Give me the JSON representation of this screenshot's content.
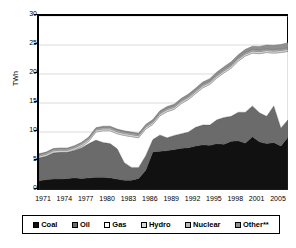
{
  "chart_data": {
    "type": "area",
    "title": "",
    "xlabel": "",
    "ylabel": "TWh",
    "ylim": [
      0,
      30
    ],
    "yticks": [
      0,
      5,
      10,
      15,
      20,
      25,
      30
    ],
    "xticks": [
      "1971",
      "1974",
      "1977",
      "1980",
      "1983",
      "1986",
      "1989",
      "1992",
      "1995",
      "1998",
      "2001",
      "2005"
    ],
    "grid": true,
    "stacked": true,
    "legend_position": "bottom",
    "x": [
      1971,
      1972,
      1973,
      1974,
      1975,
      1976,
      1977,
      1978,
      1979,
      1980,
      1981,
      1982,
      1983,
      1984,
      1985,
      1986,
      1987,
      1988,
      1989,
      1990,
      1991,
      1992,
      1993,
      1994,
      1995,
      1996,
      1997,
      1998,
      1999,
      2000,
      2001,
      2002,
      2003,
      2004,
      2005,
      2006
    ],
    "series": [
      {
        "name": "Coal",
        "color": "#111111",
        "values": [
          1.6,
          1.8,
          1.9,
          1.9,
          2.0,
          2.1,
          2.0,
          2.1,
          2.2,
          2.2,
          2.1,
          1.9,
          1.7,
          1.7,
          2.0,
          3.4,
          6.6,
          6.7,
          6.8,
          7.0,
          7.2,
          7.3,
          7.6,
          7.8,
          7.7,
          8.0,
          7.9,
          8.4,
          8.5,
          8.1,
          9.2,
          8.3,
          8.0,
          8.2,
          7.6,
          9.1
        ]
      },
      {
        "name": "Oil",
        "color": "#6b6b6b",
        "values": [
          3.9,
          4.0,
          4.5,
          4.6,
          4.5,
          4.7,
          5.3,
          5.9,
          6.4,
          6.0,
          5.9,
          5.2,
          3.0,
          2.2,
          1.9,
          2.5,
          2.1,
          2.8,
          2.2,
          2.4,
          2.5,
          2.7,
          3.2,
          3.4,
          3.5,
          4.1,
          4.6,
          4.3,
          4.9,
          5.3,
          5.3,
          5.0,
          4.7,
          6.3,
          3.1,
          3.0
        ]
      },
      {
        "name": "Gas",
        "color": "#ffffff",
        "values": [
          0.0,
          0.0,
          0.0,
          0.0,
          0.0,
          0.1,
          0.2,
          0.4,
          1.4,
          2.0,
          2.2,
          2.6,
          4.7,
          5.3,
          5.1,
          4.6,
          2.6,
          3.3,
          4.5,
          4.5,
          5.2,
          5.6,
          5.8,
          6.4,
          7.0,
          7.2,
          7.7,
          8.3,
          8.8,
          9.7,
          9.1,
          10.2,
          11.0,
          9.1,
          13.0,
          11.8
        ]
      },
      {
        "name": "Hydro",
        "color": "#d8d8d8",
        "values": [
          0.35,
          0.35,
          0.35,
          0.35,
          0.35,
          0.35,
          0.35,
          0.35,
          0.35,
          0.35,
          0.35,
          0.35,
          0.35,
          0.35,
          0.35,
          0.35,
          0.35,
          0.35,
          0.35,
          0.35,
          0.35,
          0.35,
          0.35,
          0.35,
          0.35,
          0.35,
          0.35,
          0.35,
          0.35,
          0.35,
          0.35,
          0.35,
          0.35,
          0.35,
          0.35,
          0.35
        ]
      },
      {
        "name": "Nuclear",
        "color": "#b8b8b8",
        "values": [
          0.25,
          0.25,
          0.25,
          0.25,
          0.25,
          0.25,
          0.25,
          0.25,
          0.25,
          0.25,
          0.25,
          0.25,
          0.25,
          0.25,
          0.25,
          0.25,
          0.25,
          0.25,
          0.25,
          0.25,
          0.25,
          0.25,
          0.25,
          0.25,
          0.25,
          0.25,
          0.25,
          0.25,
          0.25,
          0.25,
          0.25,
          0.25,
          0.25,
          0.25,
          0.25,
          0.25
        ]
      },
      {
        "name": "Other**",
        "color": "#8f8f8f",
        "values": [
          0.15,
          0.15,
          0.15,
          0.15,
          0.15,
          0.15,
          0.15,
          0.15,
          0.15,
          0.2,
          0.2,
          0.2,
          0.2,
          0.2,
          0.2,
          0.2,
          0.25,
          0.25,
          0.3,
          0.3,
          0.3,
          0.35,
          0.35,
          0.4,
          0.4,
          0.45,
          0.45,
          0.5,
          0.5,
          0.55,
          0.6,
          0.65,
          0.7,
          0.75,
          0.8,
          0.9
        ]
      }
    ],
    "totals_note": "Stacked totals rise from ~6.2 TWh in 1971 to ~25.5 TWh in 2006"
  },
  "legend": {
    "items": [
      {
        "label": "Coal",
        "color": "#111111"
      },
      {
        "label": "Oil",
        "color": "#6b6b6b"
      },
      {
        "label": "Gas",
        "color": "#ffffff"
      },
      {
        "label": "Hydro",
        "color": "#d8d8d8"
      },
      {
        "label": "Nuclear",
        "color": "#b8b8b8"
      },
      {
        "label": "Other**",
        "color": "#8f8f8f"
      }
    ]
  }
}
